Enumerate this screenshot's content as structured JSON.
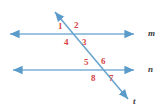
{
  "figure": {
    "background_color": "#ffffff",
    "width": 165,
    "height": 112
  },
  "colors": {
    "line": "#7BAFD4",
    "line_dark": "#5B9BC9",
    "angle_label": "#d64545",
    "line_label": "#3a3a3a"
  },
  "lines": [
    {
      "name": "line-m",
      "label": "m",
      "label_x": 148,
      "label_y": 29,
      "x1": 10,
      "y1": 34,
      "x2": 134,
      "y2": 34,
      "arrow_start": true,
      "arrow_end": true
    },
    {
      "name": "line-n",
      "label": "n",
      "label_x": 148,
      "label_y": 65,
      "x1": 13,
      "y1": 70,
      "x2": 134,
      "y2": 70,
      "arrow_start": true,
      "arrow_end": true
    },
    {
      "name": "line-t",
      "label": "t",
      "label_x": 133,
      "label_y": 97,
      "x1": 55,
      "y1": 12,
      "x2": 128,
      "y2": 99,
      "arrow_start": true,
      "arrow_end": true
    }
  ],
  "angles": [
    {
      "name": "angle-1",
      "label": "1",
      "x": 58,
      "y": 22,
      "intersection": "upper"
    },
    {
      "name": "angle-2",
      "label": "2",
      "x": 74,
      "y": 21,
      "intersection": "upper"
    },
    {
      "name": "angle-3",
      "label": "3",
      "x": 82,
      "y": 38,
      "intersection": "upper"
    },
    {
      "name": "angle-4",
      "label": "4",
      "x": 64,
      "y": 38,
      "intersection": "upper"
    },
    {
      "name": "angle-5",
      "label": "5",
      "x": 84,
      "y": 58,
      "intersection": "lower"
    },
    {
      "name": "angle-6",
      "label": "6",
      "x": 101,
      "y": 57,
      "intersection": "lower"
    },
    {
      "name": "angle-7",
      "label": "7",
      "x": 109,
      "y": 74,
      "intersection": "lower"
    },
    {
      "name": "angle-8",
      "label": "8",
      "x": 91,
      "y": 74,
      "intersection": "lower"
    }
  ]
}
